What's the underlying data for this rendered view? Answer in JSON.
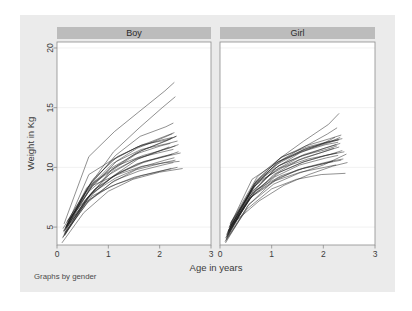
{
  "figure": {
    "background_color": "#ebebeb",
    "plot_background_color": "#ffffff",
    "header_bar_color": "#bcbcbc",
    "line_color": "#1a1a1a",
    "note": "Graphs by gender"
  },
  "axes": {
    "xlabel": "Age in years",
    "ylabel": "Weight in Kg",
    "xticks": [
      "0",
      "1",
      "2",
      "3"
    ],
    "yticks": [
      "5",
      "10",
      "15",
      "20"
    ]
  },
  "panels": [
    {
      "label": "Boy"
    },
    {
      "label": "Girl"
    }
  ],
  "chart_data": {
    "type": "line",
    "title": "",
    "subtitle": "",
    "xlabel": "Age in years",
    "ylabel": "Weight in Kg",
    "note": "Graphs by gender",
    "facet_by": "gender",
    "facets": [
      "Boy",
      "Girl"
    ],
    "xlim": [
      0,
      3
    ],
    "ylim": [
      3.5,
      20.5
    ],
    "xticks": [
      0,
      1,
      2,
      3
    ],
    "yticks": [
      5,
      10,
      15,
      20
    ],
    "grid": "horizontal",
    "legend": "none",
    "line_style": "spaghetti-per-subject",
    "panels": [
      {
        "name": "Boy",
        "series": [
          {
            "name": "b01",
            "x": [
              0.14,
              0.62,
              1.12,
              1.58,
              2.1,
              2.28
            ],
            "y": [
              5.3,
              10.9,
              13.0,
              14.6,
              16.4,
              17.1
            ]
          },
          {
            "name": "b02",
            "x": [
              0.16,
              0.6,
              1.1,
              1.6,
              2.05,
              2.3
            ],
            "y": [
              4.6,
              8.3,
              11.3,
              13.3,
              15.0,
              15.9
            ]
          },
          {
            "name": "b03",
            "x": [
              0.18,
              0.66,
              1.14,
              1.62,
              2.12,
              2.26
            ],
            "y": [
              5.1,
              8.6,
              11.0,
              12.6,
              13.4,
              13.7
            ]
          },
          {
            "name": "b04",
            "x": [
              0.12,
              0.58,
              1.08,
              1.56,
              2.08,
              2.24
            ],
            "y": [
              4.9,
              8.1,
              10.3,
              11.6,
              12.5,
              12.8
            ]
          },
          {
            "name": "b05",
            "x": [
              0.2,
              0.7,
              1.18,
              1.66,
              2.14,
              2.32
            ],
            "y": [
              5.5,
              9.0,
              10.9,
              11.9,
              12.3,
              12.6
            ]
          },
          {
            "name": "b06",
            "x": [
              0.15,
              0.64,
              1.06,
              1.54,
              2.04,
              2.22
            ],
            "y": [
              4.3,
              7.6,
              9.8,
              11.2,
              12.1,
              12.4
            ]
          },
          {
            "name": "b07",
            "x": [
              0.17,
              0.68,
              1.16,
              1.64,
              2.16,
              2.34
            ],
            "y": [
              5.0,
              8.4,
              10.5,
              11.5,
              12.0,
              12.2
            ]
          },
          {
            "name": "b08",
            "x": [
              0.13,
              0.56,
              1.04,
              1.52,
              2.02,
              2.2
            ],
            "y": [
              4.7,
              7.9,
              9.9,
              11.1,
              11.8,
              12.0
            ]
          },
          {
            "name": "b09",
            "x": [
              0.19,
              0.72,
              1.2,
              1.68,
              2.18,
              2.36
            ],
            "y": [
              5.2,
              8.8,
              10.2,
              11.0,
              11.6,
              11.9
            ]
          },
          {
            "name": "b10",
            "x": [
              0.11,
              0.54,
              1.02,
              1.5,
              2.0,
              2.18
            ],
            "y": [
              4.1,
              7.2,
              9.4,
              10.6,
              11.4,
              11.7
            ]
          },
          {
            "name": "b11",
            "x": [
              0.16,
              0.62,
              1.1,
              1.58,
              2.06,
              2.26
            ],
            "y": [
              4.8,
              8.0,
              9.7,
              10.8,
              11.3,
              11.5
            ]
          },
          {
            "name": "b12",
            "x": [
              0.22,
              0.74,
              1.22,
              1.7,
              2.2,
              2.4
            ],
            "y": [
              5.6,
              8.2,
              9.6,
              10.5,
              11.0,
              11.2
            ]
          },
          {
            "name": "b13",
            "x": [
              0.14,
              0.6,
              1.08,
              1.56,
              2.04,
              2.24
            ],
            "y": [
              4.4,
              7.5,
              9.2,
              10.3,
              10.9,
              11.1
            ]
          },
          {
            "name": "b14",
            "x": [
              0.18,
              0.66,
              1.14,
              1.62,
              2.1,
              2.28
            ],
            "y": [
              5.0,
              7.8,
              9.1,
              10.0,
              10.6,
              10.8
            ]
          },
          {
            "name": "b15",
            "x": [
              0.12,
              0.58,
              1.06,
              1.54,
              2.08,
              2.3
            ],
            "y": [
              4.2,
              7.0,
              8.7,
              9.8,
              10.4,
              10.6
            ]
          },
          {
            "name": "b16",
            "x": [
              0.2,
              0.7,
              1.18,
              1.66,
              2.12,
              2.38
            ],
            "y": [
              5.4,
              8.5,
              9.4,
              10.1,
              10.4,
              10.5
            ]
          },
          {
            "name": "b17",
            "x": [
              0.15,
              0.64,
              1.12,
              1.6,
              2.06,
              2.26
            ],
            "y": [
              4.5,
              7.3,
              8.9,
              9.7,
              10.2,
              10.4
            ]
          },
          {
            "name": "b18",
            "x": [
              0.1,
              0.52,
              1.0,
              1.48,
              2.0,
              2.44
            ],
            "y": [
              3.7,
              6.2,
              8.0,
              9.0,
              9.6,
              9.9
            ]
          },
          {
            "name": "b19",
            "x": [
              0.17,
              0.68,
              1.16,
              1.64,
              2.14,
              2.34
            ],
            "y": [
              4.9,
              7.6,
              8.6,
              9.3,
              9.8,
              10.0
            ]
          },
          {
            "name": "b20",
            "x": [
              0.13,
              0.56,
              1.04,
              1.52,
              2.02,
              2.22
            ],
            "y": [
              4.6,
              7.1,
              8.4,
              9.2,
              9.7,
              9.9
            ]
          },
          {
            "name": "b21",
            "x": [
              0.19,
              0.72,
              1.2,
              1.68,
              2.16,
              2.36
            ],
            "y": [
              5.1,
              8.1,
              9.5,
              10.4,
              11.0,
              11.3
            ]
          },
          {
            "name": "b22",
            "x": [
              0.16,
              0.6,
              1.1,
              1.58,
              2.08,
              2.3
            ],
            "y": [
              4.4,
              7.4,
              9.3,
              10.7,
              11.5,
              11.8
            ]
          },
          {
            "name": "b23",
            "x": [
              0.21,
              0.62,
              1.14,
              1.62,
              2.1,
              2.28
            ],
            "y": [
              5.3,
              9.4,
              10.8,
              11.8,
              12.6,
              12.9
            ]
          },
          {
            "name": "b24",
            "x": [
              0.14,
              0.66,
              1.08,
              1.56,
              2.04,
              2.24
            ],
            "y": [
              4.7,
              8.7,
              10.6,
              11.7,
              12.3,
              12.5
            ]
          },
          {
            "name": "b25",
            "x": [
              0.18,
              0.58,
              1.16,
              1.64,
              2.12,
              2.32
            ],
            "y": [
              5.0,
              8.3,
              10.0,
              11.4,
              12.2,
              12.6
            ]
          }
        ]
      },
      {
        "name": "Girl",
        "series": [
          {
            "name": "g01",
            "x": [
              0.15,
              0.66,
              1.14,
              1.62,
              2.1,
              2.3
            ],
            "y": [
              4.6,
              8.6,
              10.7,
              12.2,
              13.6,
              14.5
            ]
          },
          {
            "name": "g02",
            "x": [
              0.13,
              0.62,
              1.1,
              1.58,
              2.08,
              2.26
            ],
            "y": [
              4.4,
              8.2,
              10.4,
              11.6,
              12.8,
              13.3
            ]
          },
          {
            "name": "g03",
            "x": [
              0.18,
              0.7,
              1.18,
              1.66,
              2.12,
              2.34
            ],
            "y": [
              5.0,
              8.9,
              10.8,
              11.8,
              12.4,
              12.7
            ]
          },
          {
            "name": "g04",
            "x": [
              0.11,
              0.58,
              1.06,
              1.54,
              2.04,
              2.22
            ],
            "y": [
              4.1,
              7.6,
              9.9,
              11.2,
              12.1,
              12.5
            ]
          },
          {
            "name": "g05",
            "x": [
              0.2,
              0.72,
              1.2,
              1.68,
              2.14,
              2.36
            ],
            "y": [
              5.3,
              9.2,
              10.9,
              11.7,
              12.2,
              12.4
            ]
          },
          {
            "name": "g06",
            "x": [
              0.16,
              0.64,
              1.12,
              1.6,
              2.06,
              2.28
            ],
            "y": [
              4.7,
              8.3,
              10.3,
              11.4,
              12.0,
              12.3
            ]
          },
          {
            "name": "g07",
            "x": [
              0.14,
              0.6,
              1.08,
              1.56,
              2.02,
              2.24
            ],
            "y": [
              4.3,
              7.9,
              9.8,
              10.9,
              11.6,
              11.9
            ]
          },
          {
            "name": "g08",
            "x": [
              0.19,
              0.68,
              1.16,
              1.64,
              2.1,
              2.32
            ],
            "y": [
              5.1,
              8.7,
              10.2,
              11.1,
              11.7,
              12.0
            ]
          },
          {
            "name": "g09",
            "x": [
              0.12,
              0.56,
              1.04,
              1.52,
              2.0,
              2.2
            ],
            "y": [
              4.0,
              7.3,
              9.4,
              10.6,
              11.3,
              11.6
            ]
          },
          {
            "name": "g10",
            "x": [
              0.17,
              0.66,
              1.14,
              1.62,
              2.08,
              2.3
            ],
            "y": [
              4.8,
              8.4,
              9.9,
              10.8,
              11.4,
              11.7
            ]
          },
          {
            "name": "g11",
            "x": [
              0.21,
              0.74,
              1.22,
              1.7,
              2.16,
              2.4
            ],
            "y": [
              5.4,
              8.8,
              10.0,
              10.7,
              11.1,
              11.3
            ]
          },
          {
            "name": "g12",
            "x": [
              0.15,
              0.62,
              1.1,
              1.58,
              2.04,
              2.26
            ],
            "y": [
              4.5,
              7.8,
              9.5,
              10.4,
              11.0,
              11.2
            ]
          },
          {
            "name": "g13",
            "x": [
              0.13,
              0.58,
              1.06,
              1.54,
              2.06,
              2.28
            ],
            "y": [
              4.2,
              7.4,
              9.2,
              10.2,
              10.8,
              11.0
            ]
          },
          {
            "name": "g14",
            "x": [
              0.18,
              0.7,
              1.18,
              1.66,
              2.12,
              2.38
            ],
            "y": [
              5.0,
              8.1,
              9.3,
              10.0,
              10.5,
              10.7
            ]
          },
          {
            "name": "g15",
            "x": [
              0.1,
              0.54,
              1.02,
              1.5,
              1.98,
              2.18
            ],
            "y": [
              3.8,
              6.8,
              8.8,
              9.8,
              10.3,
              10.5
            ]
          },
          {
            "name": "g16",
            "x": [
              0.16,
              0.64,
              1.12,
              1.6,
              2.1,
              2.34
            ],
            "y": [
              4.6,
              7.7,
              9.1,
              9.9,
              10.4,
              10.6
            ]
          },
          {
            "name": "g17",
            "x": [
              0.22,
              0.76,
              1.24,
              1.72,
              2.18,
              2.46
            ],
            "y": [
              5.2,
              7.2,
              8.5,
              9.4,
              10.1,
              10.4
            ]
          },
          {
            "name": "g18",
            "x": [
              0.14,
              0.6,
              1.08,
              1.56,
              2.02,
              2.24
            ],
            "y": [
              4.4,
              7.5,
              8.9,
              9.6,
              10.0,
              10.2
            ]
          },
          {
            "name": "g19",
            "x": [
              0.12,
              0.52,
              1.0,
              1.48,
              1.96,
              2.42
            ],
            "y": [
              3.9,
              6.5,
              8.2,
              9.0,
              9.4,
              9.5
            ]
          },
          {
            "name": "g20",
            "x": [
              0.19,
              0.68,
              1.16,
              1.64,
              2.14,
              2.36
            ],
            "y": [
              4.9,
              8.0,
              9.6,
              10.5,
              11.1,
              11.4
            ]
          },
          {
            "name": "g21",
            "x": [
              0.17,
              0.66,
              1.14,
              1.62,
              2.08,
              2.3
            ],
            "y": [
              4.7,
              8.5,
              10.5,
              11.5,
              12.1,
              12.3
            ]
          },
          {
            "name": "g22",
            "x": [
              0.15,
              0.72,
              1.2,
              1.68,
              2.16,
              2.32
            ],
            "y": [
              4.3,
              8.9,
              10.6,
              11.6,
              12.2,
              12.5
            ]
          },
          {
            "name": "g23",
            "x": [
              0.2,
              0.62,
              1.1,
              1.58,
              2.04,
              2.28
            ],
            "y": [
              5.2,
              9.0,
              10.4,
              11.3,
              11.9,
              12.1
            ]
          },
          {
            "name": "g24",
            "x": [
              0.13,
              0.64,
              1.12,
              1.6,
              2.06,
              2.26
            ],
            "y": [
              4.1,
              8.0,
              10.1,
              11.0,
              11.5,
              11.8
            ]
          },
          {
            "name": "g25",
            "x": [
              0.11,
              0.56,
              1.04,
              1.52,
              2.0,
              2.44
            ],
            "y": [
              3.7,
              6.9,
              8.6,
              9.5,
              10.2,
              11.1
            ]
          }
        ]
      }
    ]
  }
}
